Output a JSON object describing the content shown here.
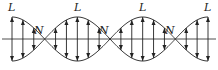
{
  "diagram": {
    "antinode_label": "L",
    "node_label": "N",
    "antinodes_x": [
      12,
      78,
      143,
      208
    ],
    "nodes_x": [
      45,
      110,
      176
    ],
    "center_y": 39,
    "amplitude": 22,
    "line_color": "#222222"
  }
}
